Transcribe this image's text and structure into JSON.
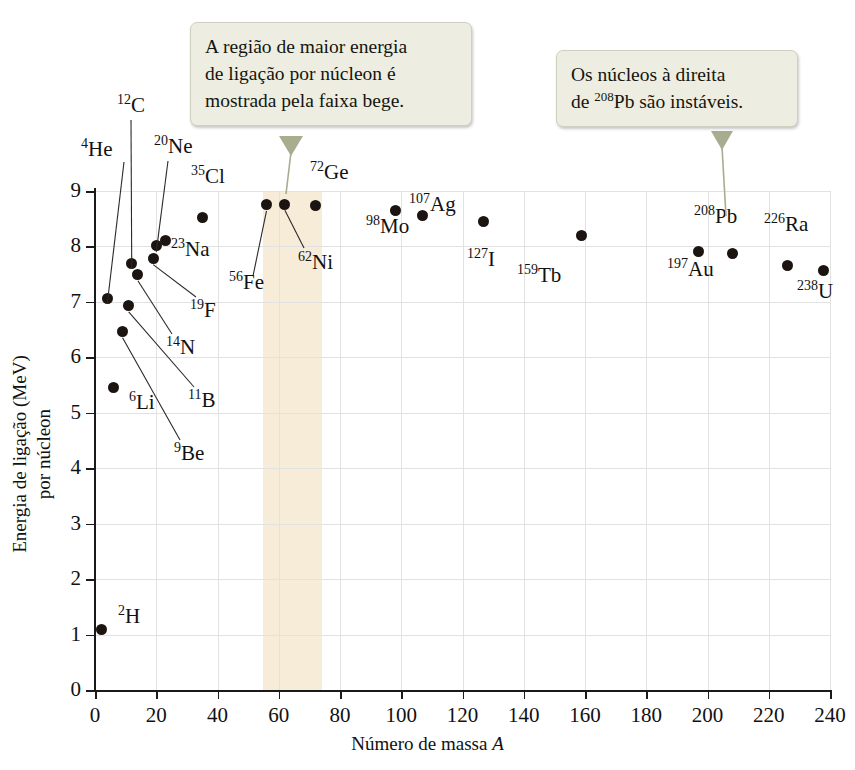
{
  "chart_data": {
    "type": "scatter",
    "title": "",
    "xlabel": "Número de massa A",
    "ylabel": "Energia de ligação por núcleon (MeV)",
    "xlim": [
      0,
      240
    ],
    "ylim": [
      0,
      9
    ],
    "xticks": [
      0,
      20,
      40,
      60,
      80,
      100,
      120,
      140,
      160,
      180,
      200,
      220,
      240
    ],
    "yticks": [
      0,
      1,
      2,
      3,
      4,
      5,
      6,
      7,
      8,
      9
    ],
    "grid": true,
    "legend": null,
    "highlight_band": {
      "label": "faixa bege",
      "color": "#f7ecd7",
      "x_start": 55,
      "x_end": 74
    },
    "points": [
      {
        "label": "2H",
        "element": "H",
        "mass": 2,
        "value": 1.1
      },
      {
        "label": "4He",
        "element": "He",
        "mass": 4,
        "value": 7.07
      },
      {
        "label": "6Li",
        "element": "Li",
        "mass": 6,
        "value": 5.45
      },
      {
        "label": "9Be",
        "element": "Be",
        "mass": 9,
        "value": 6.46
      },
      {
        "label": "11B",
        "element": "B",
        "mass": 11,
        "value": 6.93
      },
      {
        "label": "12C",
        "element": "C",
        "mass": 12,
        "value": 7.7
      },
      {
        "label": "14N",
        "element": "N",
        "mass": 14,
        "value": 7.49
      },
      {
        "label": "19F",
        "element": "F",
        "mass": 19,
        "value": 7.78
      },
      {
        "label": "20Ne",
        "element": "Ne",
        "mass": 20,
        "value": 8.01
      },
      {
        "label": "23Na",
        "element": "Na",
        "mass": 23,
        "value": 8.11
      },
      {
        "label": "35Cl",
        "element": "Cl",
        "mass": 35,
        "value": 8.52
      },
      {
        "label": "56Fe",
        "element": "Fe",
        "mass": 56,
        "value": 8.75
      },
      {
        "label": "62Ni",
        "element": "Ni",
        "mass": 62,
        "value": 8.76
      },
      {
        "label": "72Ge",
        "element": "Ge",
        "mass": 72,
        "value": 8.73
      },
      {
        "label": "98Mo",
        "element": "Mo",
        "mass": 98,
        "value": 8.64
      },
      {
        "label": "107Ag",
        "element": "Ag",
        "mass": 107,
        "value": 8.55
      },
      {
        "label": "127I",
        "element": "I",
        "mass": 127,
        "value": 8.45
      },
      {
        "label": "159Tb",
        "element": "Tb",
        "mass": 159,
        "value": 8.2
      },
      {
        "label": "197Au",
        "element": "Au",
        "mass": 197,
        "value": 7.91
      },
      {
        "label": "208Pb",
        "element": "Pb",
        "mass": 208,
        "value": 7.87
      },
      {
        "label": "226Ra",
        "element": "Ra",
        "mass": 226,
        "value": 7.66
      },
      {
        "label": "238U",
        "element": "U",
        "mass": 238,
        "value": 7.57
      }
    ]
  },
  "axis": {
    "x_title_text": "Número de massa ",
    "x_title_italic": "A",
    "y_title_line1": "Energia de ligação (MeV)",
    "y_title_line2": "por núcleon"
  },
  "labels": {
    "H": {
      "sup": "2",
      "name": "H"
    },
    "He": {
      "sup": "4",
      "name": "He"
    },
    "Li": {
      "sup": "6",
      "name": "Li"
    },
    "Be": {
      "sup": "9",
      "name": "Be"
    },
    "B": {
      "sup": "11",
      "name": "B"
    },
    "C": {
      "sup": "12",
      "name": "C"
    },
    "N": {
      "sup": "14",
      "name": "N"
    },
    "F": {
      "sup": "19",
      "name": "F"
    },
    "Ne": {
      "sup": "20",
      "name": "Ne"
    },
    "Na": {
      "sup": "23",
      "name": "Na"
    },
    "Cl": {
      "sup": "35",
      "name": "Cl"
    },
    "Fe": {
      "sup": "56",
      "name": "Fe"
    },
    "Ni": {
      "sup": "62",
      "name": "Ni"
    },
    "Ge": {
      "sup": "72",
      "name": "Ge"
    },
    "Mo": {
      "sup": "98",
      "name": "Mo"
    },
    "Ag": {
      "sup": "107",
      "name": "Ag"
    },
    "I": {
      "sup": "127",
      "name": "I"
    },
    "Tb": {
      "sup": "159",
      "name": "Tb"
    },
    "Au": {
      "sup": "197",
      "name": "Au"
    },
    "Pb": {
      "sup": "208",
      "name": "Pb"
    },
    "Ra": {
      "sup": "226",
      "name": "Ra"
    },
    "U": {
      "sup": "238",
      "name": "U"
    }
  },
  "callouts": [
    {
      "id": "callout-binding-region",
      "line1": "A região de maior energia",
      "line2": "de ligação por núcleon é",
      "line3": "mostrada pela faixa bege."
    },
    {
      "id": "callout-unstable-nuclei",
      "line1_a": "Os núcleos à direita",
      "line2_a": "de ",
      "line2_sup": "208",
      "line2_b": "Pb são instáveis."
    }
  ],
  "colors": {
    "dot": "#1b1410",
    "band": "#f7ecd7",
    "callout_bg": "#edeee1",
    "callout_border": "#cfd0bf",
    "pointer": "#a8ad90",
    "grid": "#e2e2e2",
    "axis": "#1a1a1a"
  }
}
